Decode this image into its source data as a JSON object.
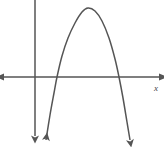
{
  "figure": {
    "kind": "coordinate-plane-graph",
    "width": 164,
    "height": 147,
    "background_color": "#ffffff",
    "stroke_color": "#555555",
    "axis_color": "#555555",
    "stroke_width": 1.5
  },
  "axes": {
    "x_axis": {
      "label": "x",
      "label_x": 156,
      "label_y": 91,
      "y_pixel": 77,
      "x_start": 4,
      "x_end": 159,
      "arrow_left": true,
      "arrow_right": true
    },
    "y_axis": {
      "label": "",
      "x_pixel": 35,
      "y_start": 0,
      "y_end": 139,
      "arrow_top": false,
      "arrow_bottom": true
    },
    "origin": {
      "x": 35,
      "y": 77
    }
  },
  "chart_data": {
    "type": "line",
    "title": "",
    "xlabel": "x",
    "ylabel": "",
    "curve": "downward-opening parabola",
    "opens": "down",
    "vertex_pixel": {
      "x": 88,
      "y": 8
    },
    "x_intercepts_pixel": [
      57,
      119
    ],
    "branch_end_left_pixel": {
      "x": 46,
      "y": 140
    },
    "branch_end_right_pixel": {
      "x": 130,
      "y": 140
    },
    "arrows_on_ends": true,
    "grid": false,
    "legend": false,
    "tick_labels": [],
    "path_points": [
      {
        "x": 46,
        "y": 140
      },
      {
        "x": 50,
        "y": 115
      },
      {
        "x": 54,
        "y": 93
      },
      {
        "x": 57,
        "y": 77
      },
      {
        "x": 62,
        "y": 56
      },
      {
        "x": 68,
        "y": 38
      },
      {
        "x": 75,
        "y": 23
      },
      {
        "x": 82,
        "y": 12
      },
      {
        "x": 88,
        "y": 8
      },
      {
        "x": 95,
        "y": 11
      },
      {
        "x": 102,
        "y": 21
      },
      {
        "x": 109,
        "y": 38
      },
      {
        "x": 115,
        "y": 59
      },
      {
        "x": 119,
        "y": 77
      },
      {
        "x": 123,
        "y": 98
      },
      {
        "x": 127,
        "y": 122
      },
      {
        "x": 130,
        "y": 140
      }
    ]
  }
}
